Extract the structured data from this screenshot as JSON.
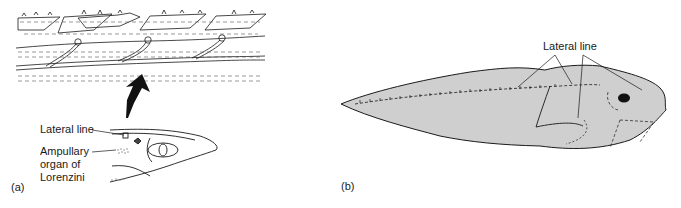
{
  "panel_a": {
    "panel_label": "(a)",
    "labels": {
      "lateral_line": "Lateral line",
      "ampullary_line1": "Ampullary",
      "ampullary_line2": "organ of",
      "ampullary_line3": "Lorenzini"
    }
  },
  "panel_b": {
    "panel_label": "(b)",
    "labels": {
      "lateral_line": "Lateral line"
    }
  },
  "colors": {
    "ink": "#1a1a1a",
    "fish_fill": "#cfcfcf",
    "background": "#ffffff"
  }
}
